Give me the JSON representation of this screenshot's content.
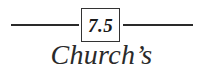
{
  "heading": {
    "section_number": "7.5",
    "title": "Church’s Theorem"
  }
}
